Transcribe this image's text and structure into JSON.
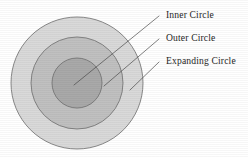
{
  "diagram": {
    "background_color": "#ffffff",
    "stroke_color": "#6e6e6e",
    "leader_color": "#4a4a4a",
    "text_color": "#262626",
    "center": {
      "cx": 77,
      "cy": 83
    },
    "circles": [
      {
        "key": "expanding",
        "label": "Expanding Circle",
        "radius": 66,
        "fill": "#d9d9d9",
        "order": 1
      },
      {
        "key": "outer",
        "label": "Outer Circle",
        "radius": 46,
        "fill": "#c0c0c0",
        "order": 2
      },
      {
        "key": "inner",
        "label": "Inner Circle",
        "radius": 25,
        "fill": "#a9a9a9",
        "order": 3
      }
    ],
    "labels": [
      {
        "key": "inner",
        "text": "Inner Circle",
        "text_x": 166,
        "text_y": 18,
        "leader": {
          "x1": 159,
          "y1": 16,
          "x2": 74,
          "y2": 85
        }
      },
      {
        "key": "outer",
        "text": "Outer Circle",
        "text_x": 166,
        "text_y": 41,
        "leader": {
          "x1": 159,
          "y1": 39,
          "x2": 104,
          "y2": 86
        }
      },
      {
        "key": "expanding",
        "text": "Expanding Circle",
        "text_x": 166,
        "text_y": 64,
        "leader": {
          "x1": 159,
          "y1": 62,
          "x2": 130,
          "y2": 90
        }
      }
    ]
  }
}
